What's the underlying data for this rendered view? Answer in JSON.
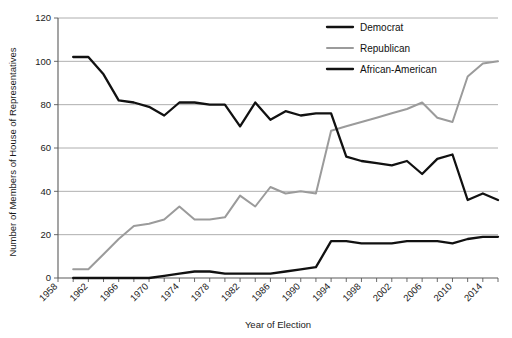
{
  "chart_data": {
    "type": "line",
    "title": "",
    "xlabel": "Year of Election",
    "ylabel": "Number of Members of House of Representatives",
    "xlim": [
      1958,
      2016
    ],
    "ylim": [
      0,
      120
    ],
    "grid": true,
    "legend_position": "top-right",
    "y_ticks": [
      0,
      20,
      40,
      60,
      80,
      100,
      120
    ],
    "x_ticks": [
      1958,
      1960,
      1962,
      1964,
      1966,
      1968,
      1970,
      1972,
      1974,
      1976,
      1978,
      1980,
      1982,
      1984,
      1986,
      1988,
      1990,
      1992,
      1994,
      1996,
      1998,
      2000,
      2002,
      2004,
      2006,
      2008,
      2010,
      2012,
      2014,
      2016
    ],
    "x_tick_labels": [
      "1958",
      "1962",
      "1966",
      "1970",
      "1974",
      "1978",
      "1982",
      "1986",
      "1990",
      "1994",
      "1998",
      "2002",
      "2006",
      "2010",
      "2014"
    ],
    "x_tick_label_years": [
      1958,
      1962,
      1966,
      1970,
      1974,
      1978,
      1982,
      1986,
      1990,
      1994,
      1998,
      2002,
      2006,
      2010,
      2014
    ],
    "x": [
      1960,
      1962,
      1964,
      1966,
      1968,
      1970,
      1972,
      1974,
      1976,
      1978,
      1980,
      1982,
      1984,
      1986,
      1988,
      1990,
      1992,
      1994,
      1996,
      1998,
      2000,
      2002,
      2004,
      2006,
      2008,
      2010,
      2012,
      2014,
      2016
    ],
    "series": [
      {
        "name": "Democrat",
        "color": "#111111",
        "width": 2.3,
        "values": [
          102,
          102,
          94,
          82,
          81,
          79,
          75,
          81,
          81,
          80,
          80,
          70,
          81,
          73,
          77,
          75,
          76,
          76,
          56,
          54,
          53,
          52,
          54,
          48,
          55,
          57,
          36,
          39,
          36
        ]
      },
      {
        "name": "Republican",
        "color": "#9b9b9b",
        "width": 2.0,
        "values": [
          4,
          4,
          11,
          18,
          24,
          25,
          27,
          33,
          27,
          27,
          28,
          38,
          33,
          42,
          39,
          40,
          39,
          68,
          70,
          72,
          74,
          76,
          78,
          81,
          74,
          72,
          93,
          99,
          100
        ]
      },
      {
        "name": "African-American",
        "color": "#111111",
        "width": 2.3,
        "values": [
          0,
          0,
          0,
          0,
          0,
          0,
          1,
          2,
          3,
          3,
          2,
          2,
          2,
          2,
          3,
          4,
          5,
          17,
          17,
          16,
          16,
          16,
          17,
          17,
          17,
          16,
          18,
          19,
          19
        ]
      }
    ]
  },
  "legend": {
    "items": [
      {
        "label": "Democrat"
      },
      {
        "label": "Republican"
      },
      {
        "label": "African-American"
      }
    ]
  },
  "axes": {
    "x_title": "Year of Election",
    "y_title": "Number of Members of House of Representatives"
  }
}
